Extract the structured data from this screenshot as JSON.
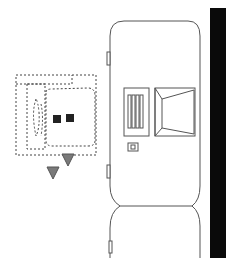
{
  "diagram": {
    "type": "plan-view line drawing",
    "colors": {
      "background": "#ffffff",
      "line": "#555555",
      "dashed": "#444444",
      "bar": "#0a0a0a",
      "square": "#222222",
      "triangle_fill": "#7a7a7a",
      "triangle_stroke": "#555555"
    },
    "elements": [
      {
        "id": "upper-body",
        "label": "upper rounded body"
      },
      {
        "id": "lower-body",
        "label": "lower rounded body"
      },
      {
        "id": "vent-panel",
        "label": "vent panel with four slots"
      },
      {
        "id": "trapezoid-panel",
        "label": "trapezoid window panel"
      },
      {
        "id": "small-switch",
        "label": "small switch"
      },
      {
        "id": "side-tabs",
        "label": "side tabs",
        "count": 3
      },
      {
        "id": "dashed-outline",
        "label": "dashed outline group"
      },
      {
        "id": "dark-squares",
        "count": 2
      },
      {
        "id": "triangle-markers",
        "count": 2
      },
      {
        "id": "black-bar",
        "label": "vertical black bar"
      }
    ]
  }
}
